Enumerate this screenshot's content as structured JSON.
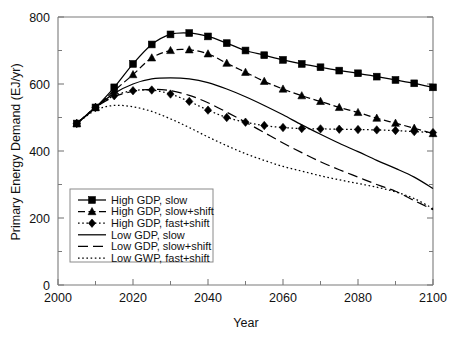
{
  "chart_data": {
    "type": "line",
    "title": "",
    "xlabel": "Year",
    "ylabel": "Primary Energy Demand (EJ/yr)",
    "xlim": [
      2000,
      2100
    ],
    "ylim": [
      0,
      800
    ],
    "x_ticks": [
      2000,
      2020,
      2040,
      2060,
      2080,
      2100
    ],
    "x_tick_labels": [
      "2000",
      "2020",
      "2040",
      "2060",
      "2080",
      "2100"
    ],
    "x_minor_ticks": [
      2010,
      2030,
      2050,
      2070,
      2090
    ],
    "y_ticks": [
      0,
      200,
      400,
      600,
      800
    ],
    "y_tick_labels": [
      "0",
      "200",
      "400",
      "600",
      "800"
    ],
    "y_minor_ticks": [
      100,
      300,
      500,
      700
    ],
    "grid": false,
    "legend_position": "lower-left-inside",
    "x": [
      2005,
      2010,
      2015,
      2020,
      2025,
      2030,
      2035,
      2040,
      2045,
      2050,
      2055,
      2060,
      2065,
      2070,
      2075,
      2080,
      2085,
      2090,
      2095,
      2100
    ],
    "series": [
      {
        "name": "High GDP, slow",
        "label": "High GDP, slow",
        "marker": "square",
        "linestyle": "solid",
        "values": [
          482,
          530,
          590,
          660,
          718,
          748,
          752,
          742,
          722,
          700,
          686,
          672,
          660,
          650,
          640,
          632,
          622,
          612,
          602,
          590
        ]
      },
      {
        "name": "High GDP, slow+shift",
        "label": "High GDP, slow+shift",
        "marker": "triangle",
        "linestyle": "dashed",
        "values": [
          482,
          530,
          580,
          628,
          678,
          700,
          702,
          690,
          662,
          635,
          608,
          585,
          565,
          548,
          530,
          515,
          498,
          483,
          468,
          452
        ]
      },
      {
        "name": "High GDP, fast+shift",
        "label": "High GDP, fast+shift",
        "marker": "diamond",
        "linestyle": "dotted",
        "values": [
          482,
          530,
          565,
          580,
          582,
          570,
          548,
          522,
          500,
          486,
          476,
          470,
          467,
          466,
          465,
          464,
          463,
          461,
          458,
          455
        ]
      },
      {
        "name": "Low GDP, slow",
        "label": "Low GDP, slow",
        "marker": "none",
        "linestyle": "solid",
        "values": [
          482,
          530,
          572,
          600,
          615,
          618,
          615,
          604,
          585,
          562,
          536,
          508,
          478,
          450,
          423,
          398,
          372,
          348,
          322,
          288
        ]
      },
      {
        "name": "Low GDP, slow+shift",
        "label": "Low GDP, slow+shift",
        "marker": "none",
        "linestyle": "longdash",
        "values": [
          482,
          530,
          562,
          578,
          584,
          580,
          566,
          544,
          516,
          486,
          455,
          424,
          395,
          368,
          344,
          322,
          300,
          280,
          252,
          225
        ]
      },
      {
        "name": "Low GWP, fast+shift",
        "label": "Low GWP, fast+shift",
        "marker": "none",
        "linestyle": "dotted",
        "values": [
          482,
          522,
          536,
          532,
          518,
          496,
          470,
          442,
          416,
          392,
          372,
          354,
          340,
          326,
          314,
          303,
          292,
          278,
          258,
          228
        ]
      }
    ],
    "colors": {
      "line": "#000000",
      "axis": "#7a7a7a",
      "text": "#111111",
      "background": "#ffffff"
    }
  }
}
